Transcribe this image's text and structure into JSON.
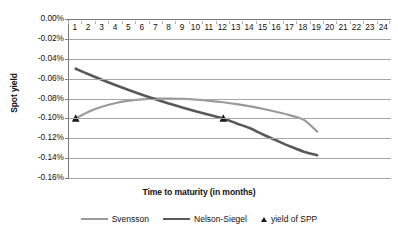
{
  "chart_data": {
    "type": "line",
    "title": "",
    "xlabel": "Time to maturity (in months)",
    "ylabel": "Spot yield",
    "x_tick_labels": [
      "1",
      "2",
      "3",
      "4",
      "5",
      "6",
      "7",
      "8",
      "9",
      "10",
      "11",
      "12",
      "13",
      "14",
      "15",
      "16",
      "17",
      "18",
      "19",
      "20",
      "21",
      "22",
      "23",
      "24"
    ],
    "y_tick_labels": [
      "0.00%",
      "-0.02%",
      "-0.04%",
      "-0.06%",
      "-0.08%",
      "-0.10%",
      "-0.12%",
      "-0.14%",
      "-0.16%"
    ],
    "y_tick_values": [
      0.0,
      -0.02,
      -0.04,
      -0.06,
      -0.08,
      -0.1,
      -0.12,
      -0.14,
      -0.16
    ],
    "xlim": [
      0.5,
      24.5
    ],
    "ylim": [
      -0.16,
      0.0
    ],
    "grid": true,
    "legend_position": "bottom",
    "series": [
      {
        "name": "Svensson",
        "type": "line",
        "color": "#9a9a9a",
        "linewidth": 2.2,
        "x": [
          1,
          2,
          3,
          4,
          5,
          6,
          7,
          8,
          9,
          10,
          11,
          12,
          13,
          14,
          15,
          16,
          17,
          18,
          19
        ],
        "values": [
          -0.1,
          -0.093,
          -0.088,
          -0.0845,
          -0.0822,
          -0.0808,
          -0.0802,
          -0.0801,
          -0.0804,
          -0.0812,
          -0.0823,
          -0.0838,
          -0.0857,
          -0.088,
          -0.0906,
          -0.0936,
          -0.097,
          -0.1015,
          -0.1133
        ]
      },
      {
        "name": "Nelson-Siegel",
        "type": "line",
        "color": "#595959",
        "linewidth": 2.6,
        "x": [
          1,
          2,
          3,
          4,
          5,
          6,
          7,
          8,
          9,
          10,
          11,
          12,
          13,
          14,
          15,
          16,
          17,
          18,
          19
        ],
        "values": [
          -0.05,
          -0.0558,
          -0.0614,
          -0.0667,
          -0.0717,
          -0.0765,
          -0.081,
          -0.0853,
          -0.0893,
          -0.0931,
          -0.0967,
          -0.1001,
          -0.1051,
          -0.11,
          -0.1165,
          -0.1225,
          -0.1283,
          -0.1335,
          -0.137
        ]
      },
      {
        "name": "yield of SPP",
        "type": "scatter",
        "marker": "triangle",
        "color": "#1a1a1a",
        "x": [
          1,
          12
        ],
        "values": [
          -0.1,
          -0.1
        ]
      }
    ]
  },
  "legend": {
    "items": [
      {
        "label": "Svensson",
        "marker": "line",
        "color": "#9a9a9a"
      },
      {
        "label": "Nelson-Siegel",
        "marker": "line",
        "color": "#595959"
      },
      {
        "label": "yield of SPP",
        "marker": "triangle",
        "color": "#1a1a1a"
      }
    ]
  },
  "colors": {
    "svensson": "#9a9a9a",
    "nelson_siegel": "#595959",
    "marker": "#1a1a1a",
    "gridline": "#a6a6a6",
    "axis": "#7b7b7b",
    "background": "#ffffff"
  }
}
